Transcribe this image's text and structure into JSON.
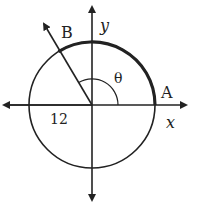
{
  "diagram": {
    "labels": {
      "point_b": "B",
      "point_a": "A",
      "y_axis": "y",
      "x_axis": "x",
      "angle": "θ",
      "radius": "12"
    },
    "colors": {
      "stroke": "#222222",
      "background": "#ffffff"
    }
  }
}
